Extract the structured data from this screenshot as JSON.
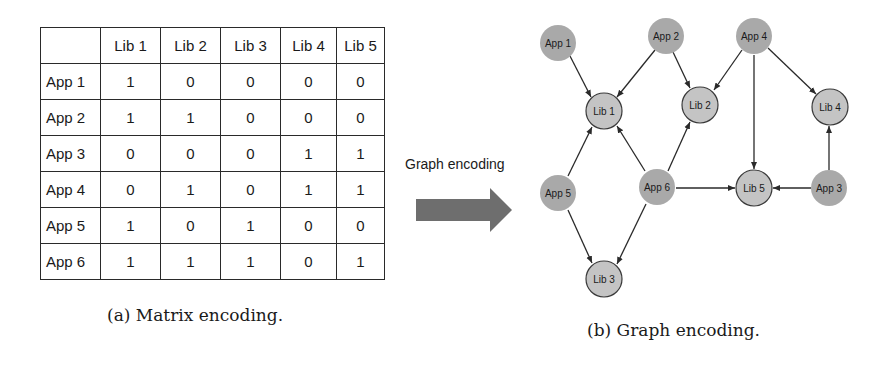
{
  "matrix": {
    "columns": [
      "",
      "Lib 1",
      "Lib 2",
      "Lib 3",
      "Lib 4",
      "Lib 5"
    ],
    "rows": [
      {
        "label": "App 1",
        "values": [
          "1",
          "0",
          "0",
          "0",
          "0"
        ]
      },
      {
        "label": "App 2",
        "values": [
          "1",
          "1",
          "0",
          "0",
          "0"
        ]
      },
      {
        "label": "App 3",
        "values": [
          "0",
          "0",
          "0",
          "1",
          "1"
        ]
      },
      {
        "label": "App 4",
        "values": [
          "0",
          "1",
          "0",
          "1",
          "1"
        ]
      },
      {
        "label": "App 5",
        "values": [
          "1",
          "0",
          "1",
          "0",
          "0"
        ]
      },
      {
        "label": "App 6",
        "values": [
          "1",
          "1",
          "1",
          "0",
          "1"
        ]
      }
    ],
    "caption": "(a) Matrix encoding."
  },
  "arrow": {
    "label": "Graph encoding",
    "color": "#6e6e6e"
  },
  "graph": {
    "caption": "(b) Graph encoding.",
    "app_color": "#a9a9a9",
    "lib_color": "#c4c4c4",
    "nodes": {
      "app1": {
        "label": "App 1"
      },
      "app2": {
        "label": "App 2"
      },
      "app3": {
        "label": "App 3"
      },
      "app4": {
        "label": "App 4"
      },
      "app5": {
        "label": "App 5"
      },
      "app6": {
        "label": "App 6"
      },
      "lib1": {
        "label": "Lib 1"
      },
      "lib2": {
        "label": "Lib 2"
      },
      "lib3": {
        "label": "Lib 3"
      },
      "lib4": {
        "label": "Lib 4"
      },
      "lib5": {
        "label": "Lib 5"
      }
    },
    "edges": [
      [
        "App 1",
        "Lib 1"
      ],
      [
        "App 2",
        "Lib 1"
      ],
      [
        "App 2",
        "Lib 2"
      ],
      [
        "App 4",
        "Lib 2"
      ],
      [
        "App 4",
        "Lib 5"
      ],
      [
        "App 4",
        "Lib 4"
      ],
      [
        "App 5",
        "Lib 1"
      ],
      [
        "App 5",
        "Lib 3"
      ],
      [
        "App 6",
        "Lib 1"
      ],
      [
        "App 6",
        "Lib 2"
      ],
      [
        "App 6",
        "Lib 3"
      ],
      [
        "App 6",
        "Lib 5"
      ],
      [
        "App 3",
        "Lib 5"
      ],
      [
        "App 3",
        "Lib 4"
      ]
    ]
  }
}
